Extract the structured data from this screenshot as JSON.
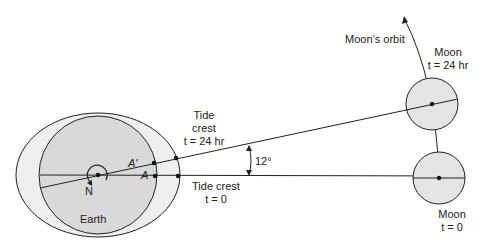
{
  "diagram": {
    "earth": {
      "label": "Earth",
      "pole_label": "N"
    },
    "points": {
      "a": "A",
      "a_prime": "A′"
    },
    "tide_crest_24": {
      "line1": "Tide",
      "line2": "crest",
      "line3": "t = 24 hr"
    },
    "tide_crest_0": {
      "line1": "Tide crest",
      "line2": "t = 0"
    },
    "angle": "12°",
    "orbit_label": "Moon’s orbit",
    "moon_24": {
      "line1": "Moon",
      "line2": "t = 24 hr"
    },
    "moon_0": {
      "line1": "Moon",
      "line2": "t = 0"
    },
    "colors": {
      "fill": "#dcdcdc",
      "bulge": "#eeeeee",
      "line": "#222222"
    }
  }
}
